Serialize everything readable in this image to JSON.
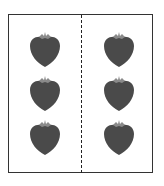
{
  "diagram": {
    "type": "grouping-illustration",
    "groups": [
      {
        "side": "left",
        "count": 3,
        "item": "strawberry"
      },
      {
        "side": "right",
        "count": 3,
        "item": "strawberry"
      }
    ],
    "total": 6,
    "colors": {
      "frame": "#333333",
      "divider": "#222222",
      "berry_body": "#4a4a4a",
      "berry_cap": "#8a8a8a"
    }
  },
  "berries": [
    {
      "x": 28,
      "y": 31
    },
    {
      "x": 28,
      "y": 75
    },
    {
      "x": 28,
      "y": 119
    },
    {
      "x": 102,
      "y": 31
    },
    {
      "x": 102,
      "y": 75
    },
    {
      "x": 102,
      "y": 119
    }
  ]
}
